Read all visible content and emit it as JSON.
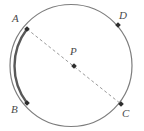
{
  "figure": {
    "type": "geometry-diagram",
    "canvas": {
      "width": 144,
      "height": 131
    },
    "background_color": "#ffffff"
  },
  "circle": {
    "name": "circle-P",
    "center_x": 71,
    "center_y": 65.5,
    "radius": 61,
    "stroke_color": "#7d7d7d",
    "stroke_width": 1.2
  },
  "highlighted_arc": {
    "name": "arc-AB",
    "from_point": "A",
    "to_point": "B",
    "side": "left",
    "stroke_color": "#585858",
    "stroke_width": 2.4
  },
  "chord": {
    "name": "diameter-AC",
    "from_point": "A",
    "to_point": "C",
    "passes_through": "P",
    "style": "dashed",
    "stroke_color": "#9a9a9a",
    "stroke_width": 1,
    "dash_pattern": "3 2.5"
  },
  "points": [
    {
      "id": "A",
      "label": "A",
      "x": 27,
      "y": 29,
      "label_x": 12,
      "label_y": 13,
      "marker_color": "#2e2e2e",
      "marker_size": 4
    },
    {
      "id": "D",
      "label": "D",
      "x": 118,
      "y": 25,
      "label_x": 119,
      "label_y": 10,
      "marker_color": "#2e2e2e",
      "marker_size": 4
    },
    {
      "id": "B",
      "label": "B",
      "x": 27,
      "y": 103,
      "label_x": 11,
      "label_y": 104,
      "marker_color": "#2e2e2e",
      "marker_size": 4
    },
    {
      "id": "C",
      "label": "C",
      "x": 121,
      "y": 104,
      "label_x": 122,
      "label_y": 108,
      "marker_color": "#2e2e2e",
      "marker_size": 4
    },
    {
      "id": "P",
      "label": "P",
      "x": 74,
      "y": 66,
      "label_x": 70,
      "label_y": 46,
      "marker_color": "#2e2e2e",
      "marker_size": 4
    }
  ]
}
